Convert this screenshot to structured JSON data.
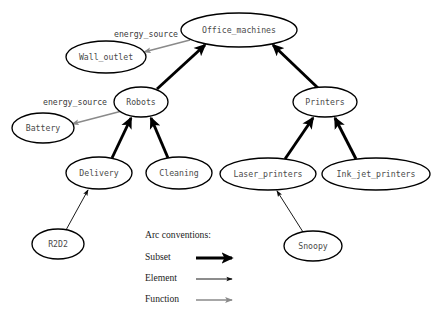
{
  "figure": {
    "background_color": "#ffffff",
    "node_fill": "#ffffff",
    "node_stroke": "#000000",
    "label_color": "#4a4a4a"
  },
  "nodes": [
    {
      "id": "office_machines",
      "label": "Office_machines",
      "cx": 239,
      "cy": 30,
      "rx": 58,
      "ry": 17
    },
    {
      "id": "wall_outlet",
      "label": "Wall_outlet",
      "cx": 106,
      "cy": 57,
      "rx": 40,
      "ry": 16
    },
    {
      "id": "robots",
      "label": "Robots",
      "cx": 141,
      "cy": 102,
      "rx": 27,
      "ry": 15
    },
    {
      "id": "battery",
      "label": "Battery",
      "cx": 43,
      "cy": 128,
      "rx": 31,
      "ry": 15
    },
    {
      "id": "printers",
      "label": "Printers",
      "cx": 325,
      "cy": 102,
      "rx": 32,
      "ry": 15
    },
    {
      "id": "delivery",
      "label": "Delivery",
      "cx": 99,
      "cy": 173,
      "rx": 33,
      "ry": 16
    },
    {
      "id": "cleaning",
      "label": "Cleaning",
      "cx": 179,
      "cy": 173,
      "rx": 33,
      "ry": 16
    },
    {
      "id": "laser_printers",
      "label": "Laser_printers",
      "cx": 268,
      "cy": 174,
      "rx": 48,
      "ry": 16
    },
    {
      "id": "ink_jet_printers",
      "label": "Ink_jet_printers",
      "cx": 376,
      "cy": 174,
      "rx": 54,
      "ry": 16
    },
    {
      "id": "r2d2",
      "label": "R2D2",
      "cx": 58,
      "cy": 244,
      "rx": 26,
      "ry": 15
    },
    {
      "id": "snoopy",
      "label": "Snoopy",
      "cx": 313,
      "cy": 246,
      "rx": 29,
      "ry": 15
    }
  ],
  "edges": [
    {
      "id": "robots-to-office",
      "from": "robots",
      "to": "office_machines",
      "kind": "Subset",
      "x1": 157,
      "y1": 89,
      "x2": 205,
      "y2": 45
    },
    {
      "id": "printers-to-office",
      "from": "printers",
      "to": "office_machines",
      "kind": "Subset",
      "x1": 318,
      "y1": 88,
      "x2": 273,
      "y2": 45
    },
    {
      "id": "delivery-to-robots",
      "from": "delivery",
      "to": "robots",
      "kind": "Subset",
      "x1": 112,
      "y1": 158,
      "x2": 131,
      "y2": 118
    },
    {
      "id": "cleaning-to-robots",
      "from": "cleaning",
      "to": "robots",
      "kind": "Subset",
      "x1": 168,
      "y1": 158,
      "x2": 151,
      "y2": 118
    },
    {
      "id": "laser-to-printers",
      "from": "laser_printers",
      "to": "printers",
      "kind": "Subset",
      "x1": 285,
      "y1": 159,
      "x2": 313,
      "y2": 118
    },
    {
      "id": "inkjet-to-printers",
      "from": "ink_jet_printers",
      "to": "printers",
      "kind": "Subset",
      "x1": 356,
      "y1": 159,
      "x2": 335,
      "y2": 118
    },
    {
      "id": "r2d2-to-delivery",
      "from": "r2d2",
      "to": "delivery",
      "kind": "Element",
      "x1": 66,
      "y1": 230,
      "x2": 88,
      "y2": 190
    },
    {
      "id": "snoopy-to-laser",
      "from": "snoopy",
      "to": "laser_printers",
      "kind": "Element",
      "x1": 303,
      "y1": 232,
      "x2": 277,
      "y2": 191
    },
    {
      "id": "office-to-wall-outlet",
      "from": "office_machines",
      "to": "wall_outlet",
      "kind": "Function",
      "x1": 190,
      "y1": 40,
      "x2": 144,
      "y2": 52,
      "label": "energy_source",
      "label_x": 146,
      "label_y": 34
    },
    {
      "id": "robots-to-battery",
      "from": "robots",
      "to": "battery",
      "kind": "Function",
      "x1": 122,
      "y1": 111,
      "x2": 72,
      "y2": 124,
      "label": "energy_source",
      "label_x": 75,
      "label_y": 102
    }
  ],
  "legend": {
    "title": "Arc conventions:",
    "title_x": 145,
    "title_y": 236,
    "items": [
      {
        "id": "subset",
        "label": "Subset",
        "x": 145,
        "y": 258,
        "line_x1": 196,
        "line_x2": 232,
        "style": "Subset"
      },
      {
        "id": "element",
        "label": "Element",
        "x": 145,
        "y": 279,
        "line_x1": 196,
        "line_x2": 232,
        "style": "Element"
      },
      {
        "id": "function",
        "label": "Function",
        "x": 145,
        "y": 300,
        "line_x1": 196,
        "line_x2": 232,
        "style": "Function"
      }
    ]
  }
}
